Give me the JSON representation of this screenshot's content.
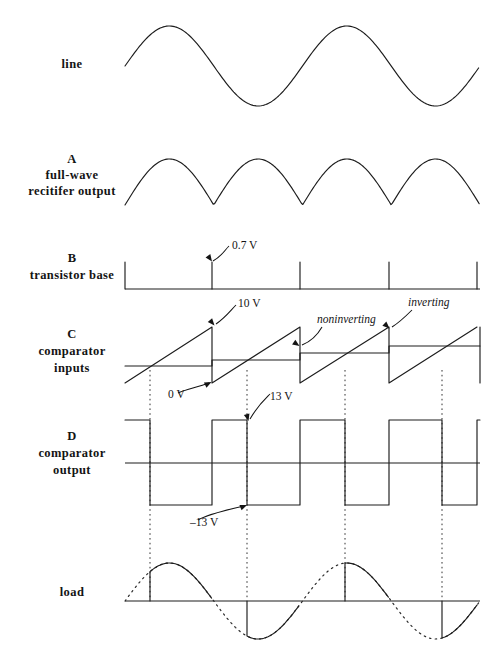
{
  "figure": {
    "title": "",
    "width": 502,
    "height": 662,
    "background": "#ffffff",
    "stroke_color": "#1c1c1c"
  },
  "rows": [
    {
      "id": "line",
      "label_lines": [
        "line"
      ],
      "label_x": 72,
      "label_y": 64,
      "baseline_y": 66,
      "type": "sine"
    },
    {
      "id": "rectifier",
      "label_lines": [
        "A",
        "full-wave",
        "recitifer output"
      ],
      "label_x": 72,
      "label_y": 172,
      "baseline_y": 205,
      "type": "full-wave-rectified"
    },
    {
      "id": "transistor-base",
      "label_lines": [
        "B",
        "transistor base"
      ],
      "label_x": 72,
      "label_y": 258,
      "baseline_y": 289,
      "type": "narrow-pulses"
    },
    {
      "id": "comparator-inputs",
      "label_lines": [
        "C",
        "comparator",
        "inputs"
      ],
      "label_x": 72,
      "label_y": 337,
      "baseline_y": 361,
      "type": "sawtooth-plus-staircase"
    },
    {
      "id": "comparator-output",
      "label_lines": [
        "D",
        "comparator",
        "output"
      ],
      "label_x": 72,
      "label_y": 438,
      "baseline_y": 463,
      "type": "square"
    },
    {
      "id": "load",
      "label_lines": [
        "load"
      ],
      "label_x": 72,
      "label_y": 596,
      "baseline_y": 601,
      "type": "phase-controlled-sine"
    }
  ],
  "annotations": [
    {
      "id": "v07",
      "text": "0.7 V",
      "x": 232,
      "y": 249,
      "style": "plain"
    },
    {
      "id": "v10",
      "text": "10 V",
      "x": 238,
      "y": 307,
      "style": "plain"
    },
    {
      "id": "v0",
      "text": "0 V",
      "x": 168,
      "y": 398,
      "style": "plain"
    },
    {
      "id": "non",
      "text": "noninverting",
      "x": 317,
      "y": 323,
      "style": "italic"
    },
    {
      "id": "inv",
      "text": "inverting",
      "x": 408,
      "y": 306,
      "style": "italic"
    },
    {
      "id": "v13",
      "text": "13 V",
      "x": 270,
      "y": 400,
      "style": "plain"
    },
    {
      "id": "vm13",
      "text": "–13 V",
      "x": 190,
      "y": 526,
      "style": "plain"
    }
  ],
  "chart_data": {
    "type": "line",
    "xlabel": "",
    "ylabel": "",
    "plot_x_start": 125,
    "plot_x_end": 480,
    "mains_half_cycles": 4,
    "half_cycle_px": 88.75,
    "grid": false,
    "legend": null,
    "dotted_gridlines_x": [
      150,
      247,
      345,
      442
    ],
    "traces": [
      {
        "name": "line",
        "row": "line",
        "description": "AC mains sine, two full cycles",
        "amplitude_px": 40,
        "cycles": 2,
        "values_note": "v(t) = A sin(2*pi*t/T), T = 177.5 px"
      },
      {
        "name": "full-wave recitifer output",
        "row": "rectifier",
        "description": "|sin| rectified, four humps, cusps at the half-cycle boundaries",
        "amplitude_px": 46,
        "humps": 4,
        "cusp_x": [
          212,
          300,
          389
        ]
      },
      {
        "name": "transistor base",
        "row": "transistor-base",
        "description": "Narrow positive pulses at each mains zero crossing",
        "pulse_height_px": 27,
        "pulse_x": [
          125,
          212,
          300,
          389,
          477
        ],
        "labeled_value": "0.7 V"
      },
      {
        "name": "inverting (ramp)",
        "row": "comparator-inputs",
        "description": "Sawtooth ramp reset at each zero crossing; peak 10 V, valley 0 V",
        "peak_label": "10 V",
        "valley_label": "0 V",
        "peak_y": 327,
        "valley_y": 383,
        "reset_x": [
          212,
          300,
          389,
          477
        ]
      },
      {
        "name": "noninverting (control level)",
        "row": "comparator-inputs",
        "description": "Slowly rising staircase DC control level crossing the ramp later each half cycle",
        "levels_y": [
          366,
          360,
          353,
          346
        ],
        "step_x": [
          125,
          212,
          300,
          389,
          480
        ]
      },
      {
        "name": "comparator output",
        "row": "comparator-output",
        "description": "Square wave toggling at each ramp/level crossing; high 13 V, low -13 V",
        "high_label": "13 V",
        "low_label": "–13 V",
        "high_y": 420,
        "low_y": 505,
        "transitions_x": [
          150,
          183,
          247,
          212,
          345,
          300,
          442,
          389
        ]
      },
      {
        "name": "load",
        "row": "load",
        "description": "Phase-chopped mains sine delivered to the load; dotted trace shows the underlying full sine",
        "amplitude_px": 38,
        "firing_x": [
          150,
          247,
          345,
          442
        ],
        "zero_cross_x": [
          125,
          212,
          300,
          389,
          477
        ]
      }
    ]
  }
}
